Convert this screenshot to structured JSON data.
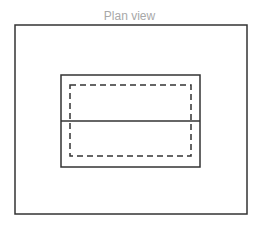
{
  "title": "Plan view",
  "colors": {
    "title": "#a8a8a8",
    "stroke": "#333333",
    "background": "#ffffff"
  },
  "shapes": {
    "outer_rect": {
      "x": 15,
      "y": 25,
      "width": 232,
      "height": 189,
      "style": "solid"
    },
    "inner_rect": {
      "x": 61,
      "y": 75,
      "width": 139,
      "height": 92,
      "style": "solid"
    },
    "dashed_rect": {
      "x": 70,
      "y": 85,
      "width": 121,
      "height": 71,
      "style": "dashed"
    },
    "center_line": {
      "x1": 61,
      "y1": 121,
      "x2": 200,
      "y2": 121,
      "style": "solid"
    }
  }
}
